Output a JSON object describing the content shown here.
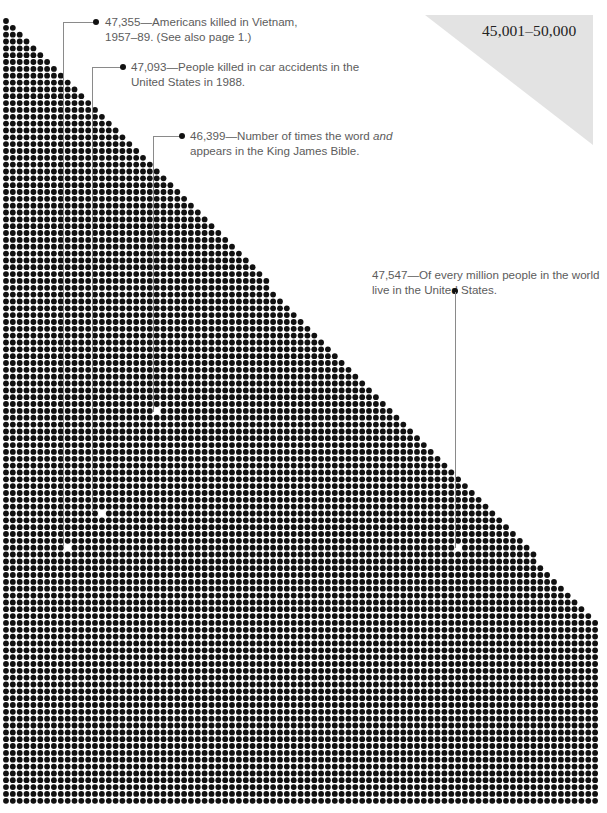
{
  "range_label": "45,001–50,000",
  "annotations": [
    {
      "value": "47,355",
      "line1": "47,355—Americans killed in Vietnam,",
      "line2": "1957–89. (See also page 1.)"
    },
    {
      "value": "47,093",
      "line1": "47,093—People killed in car accidents in the",
      "line2": "United States in 1988."
    },
    {
      "value": "46,399",
      "line1_pre": "46,399—Number of times the word ",
      "line1_em": "and",
      "line2": "appears in the King James Bible."
    },
    {
      "value": "47,547",
      "line1": "47,547—Of every million people in the world",
      "line2": "live in the United States."
    }
  ],
  "chart_data": {
    "type": "dot-matrix",
    "title": "45,001–50,000",
    "range": [
      45001,
      50000
    ],
    "grid": {
      "columns": 87,
      "rows": 115,
      "shape": "upper-left triangle then full rectangle"
    },
    "highlights": [
      {
        "value": 47355,
        "label": "Americans killed in Vietnam, 1957–89. (See also page 1.)"
      },
      {
        "value": 47093,
        "label": "People killed in car accidents in the United States in 1988."
      },
      {
        "value": 46399,
        "label": "Number of times the word and appears in the King James Bible."
      },
      {
        "value": 47547,
        "label": "Of every million people in the world live in the United States."
      }
    ],
    "colors": {
      "dot": "#111111",
      "background": "#ffffff",
      "label_triangle": "#e3e3e3",
      "annotation_text": "#5c5c5c"
    }
  }
}
